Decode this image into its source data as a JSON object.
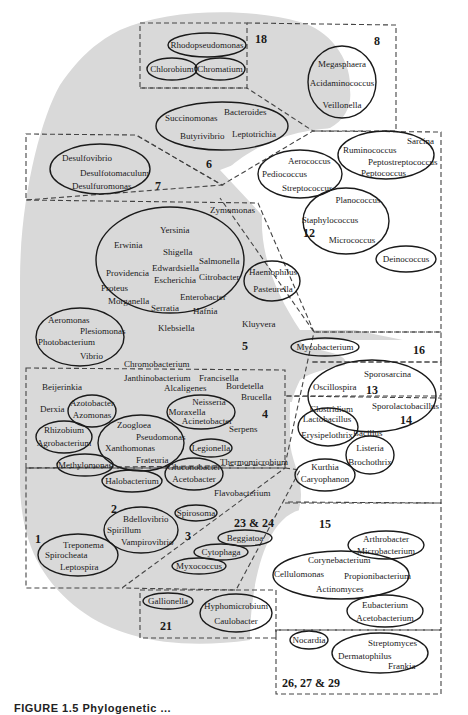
{
  "figure": {
    "caption": "FIGURE 1.5   Phylogenetic ..."
  },
  "groups": {
    "g18": {
      "number": "18",
      "taxa": [
        "Rhodopseudomonas",
        "Chlorobium",
        "Chromatium"
      ]
    },
    "g8": {
      "number": "8",
      "taxa": [
        "Megasphaera",
        "Acidaminococcus",
        "Veillonella"
      ]
    },
    "g6": {
      "number": "6",
      "taxa": [
        "Succinomonas",
        "Bacteroides",
        "Butyrivibrio",
        "Leptotrichia"
      ]
    },
    "g7": {
      "number": "7",
      "taxa": [
        "Desulfovibrio",
        "Desulfotomaculum",
        "Desulfuromonas"
      ]
    },
    "g12": {
      "number": "12",
      "taxa": [
        "Aerococcus",
        "Pediococcus",
        "Streptococcus",
        "Ruminococcus",
        "Sarcina",
        "Peptostreptococcus",
        "Peptococcus",
        "Planococcus",
        "Staphylococcus",
        "Micrococcus",
        "Deinococcus"
      ]
    },
    "g5": {
      "number": "5",
      "taxa": [
        "Zymomonas",
        "Yersinia",
        "Erwinia",
        "Shigella",
        "Salmonella",
        "Edwardsiella",
        "Escherichia",
        "Citrobacter",
        "Providencia",
        "Proteus",
        "Enterobacter",
        "Morganella",
        "Serratia",
        "Hafnia",
        "Klebsiella",
        "Haemophilus",
        "Pasteurella",
        "Aeromonas",
        "Plesiomonas",
        "Photobacterium",
        "Vibrio",
        "Kluyvera",
        "Chromobacterium"
      ]
    },
    "g16": {
      "number": "16",
      "taxa": [
        "Mycobacterium"
      ]
    },
    "g13": {
      "number": "13",
      "taxa": [
        "Sporosarcina",
        "Oscillospira",
        "Clostridium",
        "Sporolactobacillus",
        "Bacillus"
      ]
    },
    "g4": {
      "number": "4",
      "taxa": [
        "Janthinobacterium",
        "Francisella",
        "Beijerinkia",
        "Alcaligenes",
        "Bordetella",
        "Brucella",
        "Derxia",
        "Azotobacter",
        "Azomonas",
        "Neisseria",
        "Moraxella",
        "Acinetobacter",
        "Serpens",
        "Rhizobium",
        "Agrobacterium",
        "Zoogloea",
        "Pseudomonas",
        "Xanthomonas",
        "Frateuria",
        "Legionella",
        "Thermomicrobium",
        "Methylomonas",
        "Halobacterium",
        "Gluconobacter",
        "Acetobacter",
        "Flavobacterium"
      ]
    },
    "g14": {
      "number": "14",
      "taxa": [
        "Lactobacillus",
        "Erysipelothrix",
        "Listeria",
        "Brochothrix",
        "Kurthia",
        "Caryophanon"
      ]
    },
    "g1": {
      "number": "1",
      "taxa": [
        "Treponema",
        "Spirocheata",
        "Leptospira"
      ]
    },
    "g2": {
      "number": "2",
      "taxa": [
        "Bdellovibrio",
        "Spirillum",
        "Vampirovibrio"
      ]
    },
    "g3": {
      "number": "3",
      "taxa": [
        "Spirosoma"
      ]
    },
    "g23": {
      "number": "23 & 24",
      "taxa": [
        "Beggiatoa",
        "Cytophaga",
        "Myxococcus"
      ]
    },
    "g15": {
      "number": "15",
      "taxa": [
        "Arthrobacter",
        "Microbacterium",
        "Corynebacterium",
        "Cellulomonas",
        "Propionibacterium",
        "Actinomyces",
        "Eubacterium",
        "Acetobacterium"
      ]
    },
    "g21": {
      "number": "21",
      "taxa": [
        "Gallionella",
        "Hyphomicrobium",
        "Caulobacter"
      ]
    },
    "g26": {
      "number": "26, 27 & 29",
      "taxa": [
        "Nocardia",
        "Streptomyces",
        "Dermatophilus",
        "Frankia"
      ]
    }
  }
}
